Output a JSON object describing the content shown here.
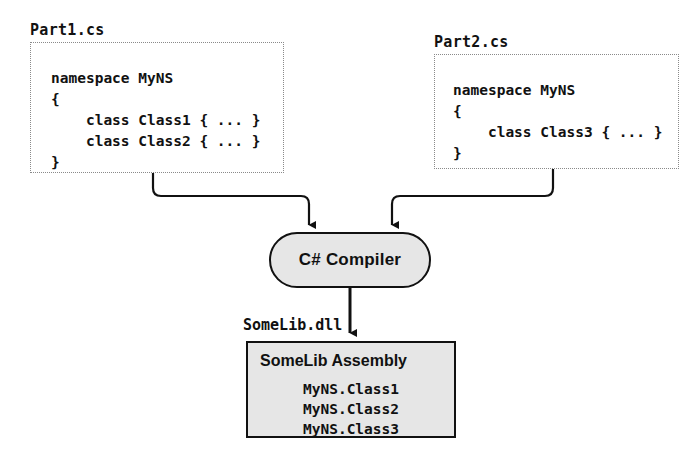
{
  "diagram": {
    "background_color": "#ffffff",
    "line_color": "#111111",
    "fill_color": "#e6e6e6"
  },
  "sources": [
    {
      "file_label": "Part1.cs",
      "code": "namespace MyNS\n{\n    class Class1 { ... }\n    class Class2 { ... }\n}"
    },
    {
      "file_label": "Part2.cs",
      "code": "namespace MyNS\n{\n    class Class3 { ... }\n}"
    }
  ],
  "compiler": {
    "label": "C# Compiler"
  },
  "output": {
    "file_label": "SomeLib.dll",
    "assembly_title": "SomeLib Assembly",
    "types": [
      "MyNS.Class1",
      "MyNS.Class2",
      "MyNS.Class3"
    ]
  }
}
